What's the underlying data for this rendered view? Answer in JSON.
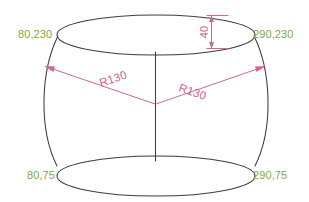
{
  "drawing": {
    "title": "Barrel solid of revolution dimensioned drawing",
    "background_color": "#ffffff",
    "geometry_color": "#3d3d3d",
    "coordinate_label_color": "#84a83c",
    "dimension_color": "#cf5f92"
  },
  "coordinate_labels": [
    {
      "id": "top-left",
      "text": "80,230",
      "x": 80,
      "y": 230
    },
    {
      "id": "top-right",
      "text": "290,230",
      "x": 290,
      "y": 230
    },
    {
      "id": "bottom-left",
      "text": "80,75",
      "x": 80,
      "y": 75
    },
    {
      "id": "bottom-right",
      "text": "290,75",
      "x": 290,
      "y": 75
    }
  ],
  "dimensions": [
    {
      "id": "radius-left",
      "text": "R130",
      "value": 130,
      "symbol": "R"
    },
    {
      "id": "radius-right",
      "text": "R130",
      "value": 130,
      "symbol": "R"
    },
    {
      "id": "ellipse-minor",
      "text": "40",
      "value": 40,
      "symbol": ""
    }
  ]
}
